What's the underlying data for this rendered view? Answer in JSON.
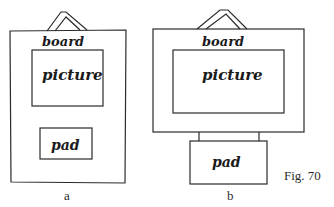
{
  "figure": {
    "caption": "Fig. 70",
    "panels": [
      {
        "id": "a",
        "label": "a",
        "board_label": "board",
        "picture_label": "picture",
        "pad_label": "pad"
      },
      {
        "id": "b",
        "label": "b",
        "board_label": "board",
        "picture_label": "picture",
        "pad_label": "pad"
      }
    ]
  }
}
